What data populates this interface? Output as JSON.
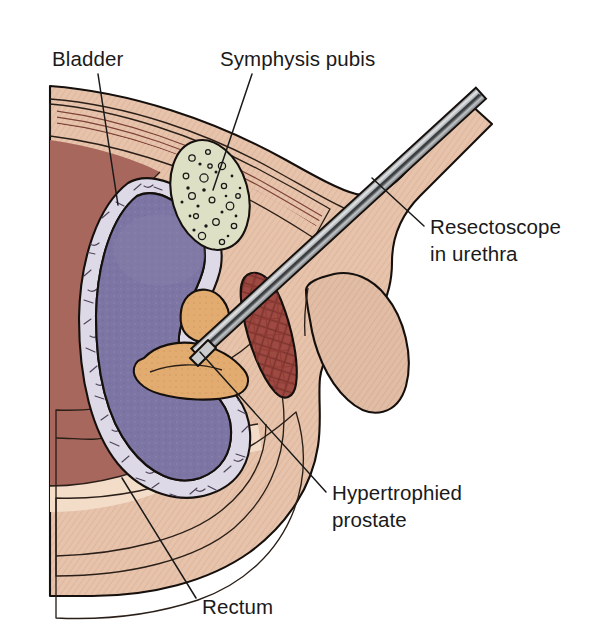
{
  "figure": {
    "background_color": "#ffffff",
    "width": 593,
    "height": 624
  },
  "labels": [
    {
      "id": "bladder",
      "name": "Bladder",
      "lines": [
        "Bladder"
      ],
      "text_x": 52,
      "text_y": 66,
      "anchor": "start",
      "leader": [
        [
          98,
          74
        ],
        [
          118,
          205
        ]
      ]
    },
    {
      "id": "symphysis-pubis",
      "name": "Symphysis pubis",
      "lines": [
        "Symphysis pubis"
      ],
      "text_x": 220,
      "text_y": 66,
      "anchor": "start",
      "leader": [
        [
          252,
          74
        ],
        [
          213,
          190
        ]
      ]
    },
    {
      "id": "resectoscope",
      "name": "Resectoscope in urethra",
      "lines": [
        "Resectoscope",
        "in urethra"
      ],
      "text_x": 430,
      "text_y": 234,
      "anchor": "start",
      "leader": [
        [
          424,
          226
        ],
        [
          372,
          178
        ]
      ]
    },
    {
      "id": "hypertrophied-prostate",
      "name": "Hypertrophied prostate",
      "lines": [
        "Hypertrophied",
        "prostate"
      ],
      "text_x": 332,
      "text_y": 500,
      "anchor": "start",
      "leader": [
        [
          326,
          492
        ],
        [
          200,
          352
        ]
      ]
    },
    {
      "id": "rectum",
      "name": "Rectum",
      "lines": [
        "Rectum"
      ],
      "text_x": 202,
      "text_y": 614,
      "anchor": "start",
      "leader": [
        [
          196,
          598
        ],
        [
          122,
          478
        ]
      ]
    }
  ],
  "structures": [
    {
      "id": "skin-body",
      "name": "skin-and-subcutaneous-tissue",
      "color": "#e7c3ab"
    },
    {
      "id": "penile-shaft",
      "name": "penile-shaft",
      "color": "#e2bda6"
    },
    {
      "id": "abdominal-muscle",
      "name": "abdominal-wall-muscle",
      "color": "#9a5f54"
    },
    {
      "id": "muscle-striation",
      "name": "muscle-striation-lines",
      "color": "#7d4238"
    },
    {
      "id": "peritoneum",
      "name": "peritoneal-fat-layer",
      "color": "#f0d6c2"
    },
    {
      "id": "bladder-lumen",
      "name": "bladder-lumen",
      "color": "#7d76a4"
    },
    {
      "id": "bladder-wall",
      "name": "bladder-wall",
      "color": "#ded9e6"
    },
    {
      "id": "pubic-bone",
      "name": "symphysis-pubis-bone",
      "color": "#dde0c4"
    },
    {
      "id": "prostate",
      "name": "hypertrophied-prostate",
      "color": "#e2ab70"
    },
    {
      "id": "corpus-cavernosum",
      "name": "corpus-cavernosum",
      "color": "#9e4a42"
    },
    {
      "id": "rectum-wall",
      "name": "rectum-wall",
      "color": "#a8463a"
    },
    {
      "id": "rectum-outer",
      "name": "rectum-outer-layer",
      "color": "#e9c5ae"
    },
    {
      "id": "seminal-vesicle",
      "name": "seminal-vesicle",
      "color": "#d9d7bc"
    },
    {
      "id": "vesicle-lumen",
      "name": "seminal-vesicle-lumen",
      "color": "#8d7a63"
    },
    {
      "id": "scrotum",
      "name": "scrotum-and-testis",
      "color": "#e0bba4"
    },
    {
      "id": "resectoscope-shaft",
      "name": "resectoscope-shaft",
      "color": "#c9cbcc"
    },
    {
      "id": "outline",
      "name": "anatomical-outline",
      "color": "#15100d"
    }
  ]
}
